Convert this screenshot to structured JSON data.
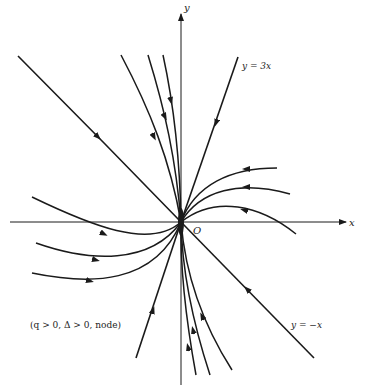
{
  "figure": {
    "type": "phase-portrait",
    "axes": {
      "x_label": "x",
      "y_label": "y",
      "origin_label": "O"
    },
    "lines": {
      "line_3x_label": "y = 3x",
      "line_neg_x_label": "y = −x"
    },
    "caption": "(q > 0, Δ > 0, node)",
    "colors": {
      "ink": "#1a1a1a",
      "background": "#ffffff"
    }
  }
}
